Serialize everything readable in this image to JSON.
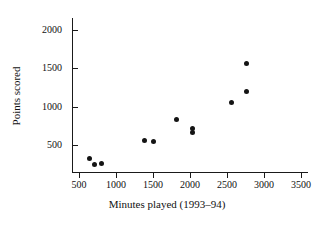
{
  "chart_data": {
    "type": "scatter",
    "title": "",
    "xlabel": "Minutes played (1993–94)",
    "ylabel": "Points scored",
    "xlim": [
      400,
      3600
    ],
    "ylim": [
      150,
      2150
    ],
    "xticks": [
      500,
      1000,
      1500,
      2000,
      2500,
      3000,
      3500
    ],
    "yticks": [
      500,
      1000,
      1500,
      2000
    ],
    "xtick_labels": [
      "500",
      "1000",
      "1500",
      "2000",
      "2500",
      "3000",
      "3500"
    ],
    "ytick_labels": [
      "500",
      "1000",
      "1500",
      "2000"
    ],
    "grid": false,
    "legend": null,
    "marker": "filled-circle",
    "marker_color": "#141414",
    "points": [
      {
        "x": 640,
        "y": 330
      },
      {
        "x": 710,
        "y": 250
      },
      {
        "x": 800,
        "y": 255
      },
      {
        "x": 1380,
        "y": 565
      },
      {
        "x": 1500,
        "y": 545
      },
      {
        "x": 1820,
        "y": 830
      },
      {
        "x": 2030,
        "y": 720
      },
      {
        "x": 2030,
        "y": 665
      },
      {
        "x": 2560,
        "y": 1050
      },
      {
        "x": 2760,
        "y": 1200
      },
      {
        "x": 2760,
        "y": 1560
      }
    ]
  },
  "axes": {
    "y_axis_name": "points-scored-axis",
    "x_axis_name": "minutes-played-axis"
  }
}
